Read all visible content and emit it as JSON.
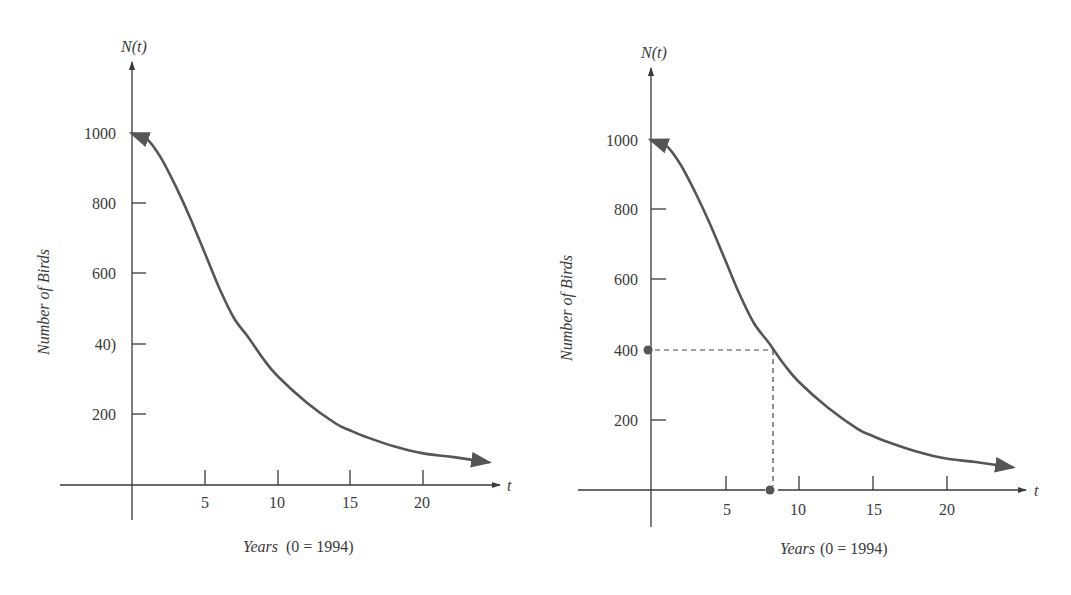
{
  "figure": {
    "colors": {
      "axis": "#3a3a3a",
      "curve": "#555555",
      "dashed": "#444444",
      "marker": "#555555",
      "text": "#3a3a3a"
    }
  },
  "chart_data": [
    {
      "id": "left",
      "type": "line",
      "title": "",
      "xlabel": "Years",
      "xlabel_suffix": "(0 = 1994)",
      "ylabel": "Number of Birds",
      "y_variable_label": "N(t)",
      "x_variable_label": "t",
      "xlim": [
        -5,
        25
      ],
      "ylim": [
        0,
        1150
      ],
      "x_ticks": [
        5,
        10,
        15,
        20
      ],
      "x_tick_labels": [
        "5",
        "10",
        "15",
        "20"
      ],
      "y_ticks": [
        200,
        400,
        600,
        800,
        1000
      ],
      "y_tick_labels": [
        "200",
        "40)",
        "600",
        "800",
        "1000"
      ],
      "grid": false,
      "legend": null,
      "series": [
        {
          "name": "N(t)",
          "x": [
            0,
            1,
            2,
            3,
            4,
            5,
            6,
            7,
            8,
            9,
            10,
            12,
            14,
            15,
            16,
            18,
            20,
            22,
            24.5
          ],
          "values": [
            1000,
            985,
            930,
            850,
            760,
            660,
            560,
            475,
            420,
            360,
            310,
            235,
            175,
            155,
            138,
            110,
            90,
            80,
            65
          ],
          "start_arrow": true,
          "end_arrow": true
        }
      ],
      "annotations": []
    },
    {
      "id": "right",
      "type": "line",
      "title": "",
      "xlabel": "Years",
      "xlabel_suffix": "(0 = 1994)",
      "ylabel": "Number of Birds",
      "y_variable_label": "N(t)",
      "x_variable_label": "t",
      "xlim": [
        -5,
        25
      ],
      "ylim": [
        0,
        1150
      ],
      "x_ticks": [
        5,
        10,
        15,
        20
      ],
      "x_tick_labels": [
        "5",
        "10",
        "15",
        "20"
      ],
      "y_ticks": [
        200,
        400,
        600,
        800,
        1000
      ],
      "y_tick_labels": [
        "200",
        "400",
        "600",
        "800",
        "1000"
      ],
      "grid": false,
      "legend": null,
      "series": [
        {
          "name": "N(t)",
          "x": [
            0,
            1,
            2,
            3,
            4,
            5,
            6,
            7,
            8,
            9,
            10,
            12,
            14,
            15,
            16,
            18,
            20,
            22,
            24.5
          ],
          "values": [
            1000,
            985,
            930,
            850,
            760,
            660,
            560,
            475,
            420,
            360,
            310,
            235,
            175,
            155,
            138,
            110,
            90,
            80,
            65
          ],
          "start_arrow": true,
          "end_arrow": true
        }
      ],
      "annotations": [
        {
          "type": "dashed-guide",
          "description": "Reading N(t)=400 to find t",
          "y_value": 400,
          "x_value": 8.3,
          "point_on_y_axis": {
            "x": 0,
            "y": 400
          },
          "point_on_x_axis": {
            "x": 8.3,
            "y": 0
          }
        }
      ]
    }
  ],
  "charts": {
    "left": {
      "y_var": "N(t)",
      "x_var": "t",
      "ylabel": "Number of Birds",
      "xlabel": "Years",
      "xlabel_suffix": "(0 = 1994)",
      "y_tick_labels": [
        "200",
        "40)",
        "600",
        "800",
        "1000"
      ],
      "x_tick_labels": [
        "5",
        "10",
        "15",
        "20"
      ]
    },
    "right": {
      "y_var": "N(t)",
      "x_var": "t",
      "ylabel": "Number of Birds",
      "xlabel": "Years",
      "xlabel_suffix": "(0 = 1994)",
      "y_tick_labels": [
        "200",
        "400",
        "600",
        "800",
        "1000"
      ],
      "x_tick_labels": [
        "5",
        "10",
        "15",
        "20"
      ]
    }
  }
}
